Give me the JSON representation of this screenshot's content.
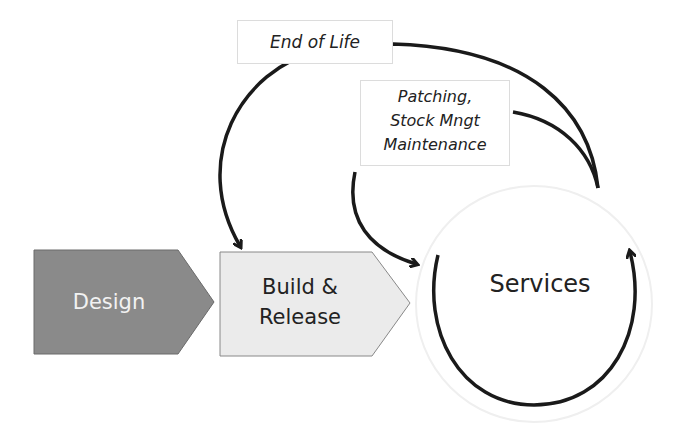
{
  "diagram": {
    "stages": [
      {
        "id": "design",
        "label": "Design",
        "fill": "#8a8a8a",
        "text_color": "#f2f2f2"
      },
      {
        "id": "build",
        "label_line1": "Build &",
        "label_line2": "Release",
        "fill": "#ebebeb",
        "text_color": "#222222"
      },
      {
        "id": "services",
        "label": "Services",
        "shape": "circle"
      }
    ],
    "feedback_labels": {
      "end_of_life": "End of Life",
      "patching_line1": "Patching,",
      "patching_line2": "Stock Mngt",
      "patching_line3": "Maintenance"
    },
    "edges": [
      {
        "from": "services",
        "to": "build",
        "label": "End of Life"
      },
      {
        "from": "services",
        "to": "services",
        "label": "Patching, Stock Mngt Maintenance"
      },
      {
        "from": "services",
        "to": "services",
        "label": "cycle"
      }
    ],
    "colors": {
      "arrow": "#1a1a1a",
      "box_border": "#dcdcdc"
    }
  }
}
